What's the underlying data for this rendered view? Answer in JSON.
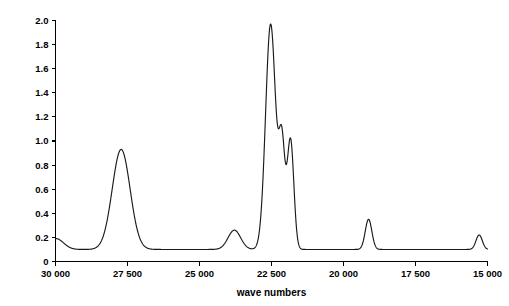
{
  "chart_data": {
    "type": "line",
    "title": "",
    "xlabel": "wave numbers",
    "ylabel": "absorbance",
    "xlim": [
      30000,
      15000
    ],
    "ylim": [
      0,
      2.0
    ],
    "x_axis_reversed": true,
    "grid": false,
    "legend": null,
    "xticks": [
      30000,
      27500,
      25000,
      22500,
      20000,
      17500,
      15000
    ],
    "xtick_labels": [
      "30 000",
      "27 500",
      "25 000",
      "22 500",
      "20 000",
      "17 500",
      "15 000"
    ],
    "yticks": [
      0,
      0.2,
      0.4,
      0.6,
      0.8,
      1.0,
      1.2,
      1.4,
      1.6,
      1.8,
      2.0
    ],
    "ytick_labels": [
      "0",
      "0.2",
      "0.4",
      "0.6",
      "0.8",
      "1.0",
      "1.2",
      "1.4",
      "1.6",
      "1.8",
      "2.0"
    ],
    "baseline": 0.1,
    "line_color": "#1a1a1a",
    "series": [
      {
        "name": "absorbance spectrum",
        "peaks": [
          {
            "center": 29980,
            "height": 0.09,
            "width": 260,
            "label": "edge rise"
          },
          {
            "center": 27720,
            "height": 0.83,
            "width": 310,
            "label": "peak 1"
          },
          {
            "center": 23790,
            "height": 0.16,
            "width": 220,
            "label": "peak 2"
          },
          {
            "center": 22530,
            "height": 1.87,
            "width": 175,
            "label": "peak 3 (main)"
          },
          {
            "center": 22140,
            "height": 0.83,
            "width": 105,
            "label": "peak 4"
          },
          {
            "center": 21840,
            "height": 0.91,
            "width": 115,
            "label": "peak 5"
          },
          {
            "center": 19130,
            "height": 0.25,
            "width": 115,
            "label": "peak 6"
          },
          {
            "center": 15290,
            "height": 0.12,
            "width": 110,
            "label": "peak 7"
          }
        ]
      }
    ],
    "peak_maxima": [
      {
        "wavenumber": 27720,
        "absorbance": 0.93
      },
      {
        "wavenumber": 23790,
        "absorbance": 0.26
      },
      {
        "wavenumber": 22530,
        "absorbance": 1.97
      },
      {
        "wavenumber": 22140,
        "absorbance": 0.93
      },
      {
        "wavenumber": 21840,
        "absorbance": 1.01
      },
      {
        "wavenumber": 19130,
        "absorbance": 0.35
      },
      {
        "wavenumber": 15290,
        "absorbance": 0.22
      }
    ]
  },
  "figure": {
    "background_color": "#ffffff",
    "axis_color": "#000000"
  }
}
